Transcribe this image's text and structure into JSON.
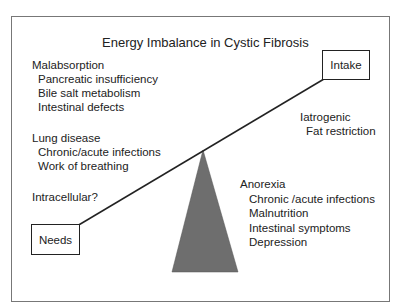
{
  "title": "Energy  Imbalance in Cystic Fibrosis",
  "boxes": {
    "intake": "Intake",
    "needs": "Needs"
  },
  "needs_side": {
    "malabsorption": {
      "heading": "Malabsorption",
      "items": [
        "Pancreatic insufficiency",
        "Bile salt metabolism",
        "Intestinal defects"
      ]
    },
    "lung_disease": {
      "heading": "Lung disease",
      "items": [
        "Chronic/acute infections",
        "Work of breathing"
      ]
    },
    "intracellular": "Intracellular?"
  },
  "intake_side": {
    "iatrogenic": {
      "heading": "Iatrogenic",
      "items": [
        "Fat restriction"
      ]
    },
    "anorexia": {
      "heading": "Anorexia",
      "items": [
        "Chronic /acute infections",
        "Malnutrition",
        "Intestinal symptoms",
        "Depression"
      ]
    }
  },
  "colors": {
    "fulcrum": "#6e6e6e",
    "line": "#222222",
    "frame": "#777777"
  }
}
